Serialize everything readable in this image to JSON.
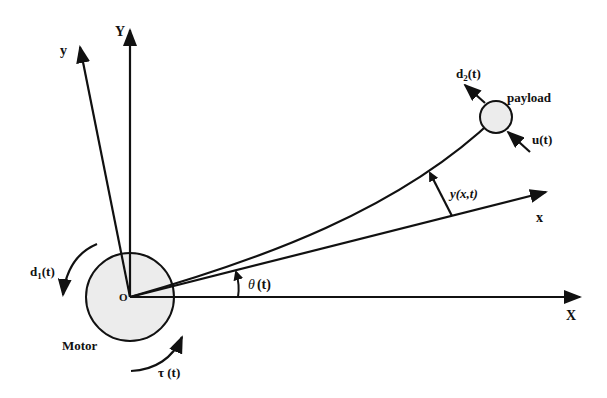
{
  "diagram": {
    "type": "flexible-link-manipulator",
    "colors": {
      "stroke": "#111111",
      "motor_fill": "#ececec",
      "payload_fill": "#ececec",
      "background": "#ffffff"
    },
    "labels": {
      "Y_axis": "Y",
      "y_axis": "y",
      "X_axis": "X",
      "x_axis": "x",
      "origin": "O",
      "motor": "Motor",
      "payload": "payload",
      "disturbance_motor": "d",
      "disturbance_motor_sub": "1",
      "disturbance_motor_suffix": "(t)",
      "disturbance_payload": "d",
      "disturbance_payload_sub": "2",
      "disturbance_payload_suffix": "(t)",
      "control_input": "u(t)",
      "deflection": "y(x,t)",
      "angle_symbol": "θ",
      "angle_suffix": "(t)",
      "torque": "τ (t)"
    }
  }
}
